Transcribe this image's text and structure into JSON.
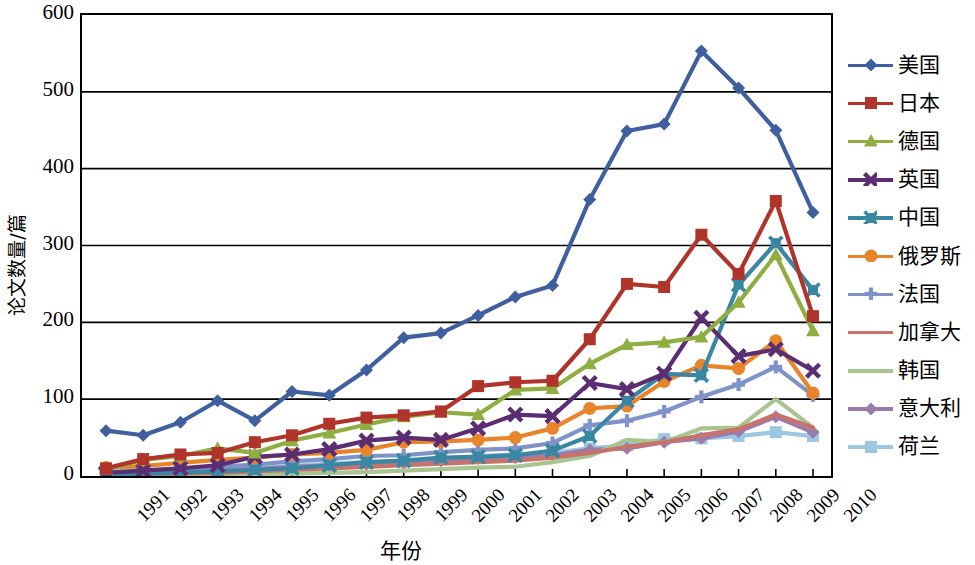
{
  "chart_data": {
    "type": "line",
    "title": "",
    "xlabel": "年份",
    "ylabel": "论文数量/篇",
    "ylim": [
      0,
      600
    ],
    "yticks": [
      600,
      500,
      400,
      300,
      200,
      100,
      0
    ],
    "grid": "horizontal",
    "legend_position": "right",
    "categories": [
      "1991",
      "1992",
      "1993",
      "1994",
      "1995",
      "1996",
      "1997",
      "1998",
      "1999",
      "2000",
      "2001",
      "2002",
      "2003",
      "2004",
      "2005",
      "2006",
      "2007",
      "2008",
      "2009",
      "2010"
    ],
    "series": [
      {
        "name": "美国",
        "color": "#3f5f9e",
        "marker": "diamond",
        "values": [
          59,
          53,
          70,
          98,
          72,
          110,
          105,
          138,
          180,
          186,
          209,
          233,
          248,
          360,
          449,
          458,
          553,
          505,
          450,
          343
        ]
      },
      {
        "name": "日本",
        "color": "#b0342a",
        "marker": "square",
        "values": [
          10,
          22,
          28,
          30,
          44,
          53,
          68,
          76,
          79,
          84,
          117,
          122,
          124,
          178,
          250,
          246,
          314,
          263,
          358,
          208
        ]
      },
      {
        "name": "德国",
        "color": "#8fae41",
        "marker": "triangle",
        "values": [
          9,
          21,
          26,
          36,
          30,
          46,
          56,
          67,
          77,
          83,
          80,
          112,
          114,
          146,
          171,
          174,
          181,
          226,
          288,
          189
        ]
      },
      {
        "name": "英国",
        "color": "#5b2d73",
        "marker": "x",
        "values": [
          4,
          7,
          10,
          14,
          25,
          28,
          35,
          46,
          50,
          47,
          62,
          80,
          78,
          121,
          113,
          133,
          206,
          156,
          165,
          137
        ]
      },
      {
        "name": "中国",
        "color": "#3a87a3",
        "marker": "xbox",
        "values": [
          2,
          3,
          4,
          6,
          8,
          10,
          14,
          18,
          20,
          24,
          25,
          27,
          33,
          52,
          98,
          133,
          131,
          249,
          303,
          242
        ]
      },
      {
        "name": "俄罗斯",
        "color": "#e8852a",
        "marker": "circle",
        "values": [
          11,
          13,
          17,
          21,
          24,
          28,
          30,
          34,
          44,
          45,
          47,
          50,
          62,
          88,
          91,
          123,
          144,
          140,
          176,
          108
        ]
      },
      {
        "name": "法国",
        "color": "#8093c8",
        "marker": "plus",
        "values": [
          4,
          6,
          9,
          12,
          15,
          19,
          22,
          26,
          27,
          31,
          34,
          36,
          43,
          66,
          72,
          84,
          103,
          119,
          142,
          105
        ]
      },
      {
        "name": "加拿大",
        "color": "#c8736a",
        "marker": "line",
        "values": [
          1,
          2,
          3,
          4,
          6,
          8,
          10,
          12,
          14,
          16,
          18,
          20,
          24,
          30,
          38,
          44,
          53,
          61,
          80,
          63
        ]
      },
      {
        "name": "韩国",
        "color": "#a8c491",
        "marker": "line",
        "values": [
          0,
          0,
          1,
          1,
          2,
          3,
          4,
          5,
          7,
          9,
          11,
          12,
          18,
          26,
          47,
          44,
          62,
          63,
          100,
          63
        ]
      },
      {
        "name": "意大利",
        "color": "#9b7bab",
        "marker": "diamond",
        "values": [
          5,
          3,
          6,
          8,
          9,
          12,
          14,
          16,
          17,
          20,
          23,
          24,
          27,
          34,
          36,
          44,
          49,
          58,
          77,
          57
        ]
      },
      {
        "name": "荷兰",
        "color": "#9cc7e0",
        "marker": "square",
        "values": [
          7,
          8,
          9,
          10,
          11,
          13,
          16,
          18,
          19,
          22,
          26,
          28,
          30,
          36,
          40,
          48,
          49,
          52,
          57,
          52
        ]
      }
    ]
  },
  "legend": {
    "items": [
      {
        "label": "美国"
      },
      {
        "label": "日本"
      },
      {
        "label": "德国"
      },
      {
        "label": "英国"
      },
      {
        "label": "中国"
      },
      {
        "label": "俄罗斯"
      },
      {
        "label": "法国"
      },
      {
        "label": "加拿大"
      },
      {
        "label": "韩国"
      },
      {
        "label": "意大利"
      },
      {
        "label": "荷兰"
      }
    ]
  }
}
